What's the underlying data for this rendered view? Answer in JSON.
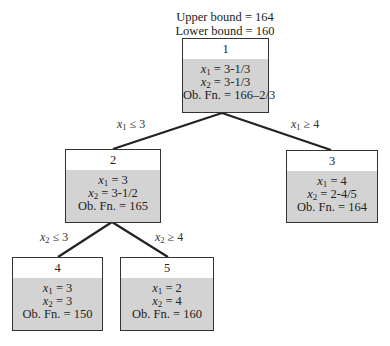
{
  "bounds": {
    "upper": "Upper bound = 164",
    "lower": "Lower bound = 160"
  },
  "nodes": [
    {
      "id": "1",
      "x1": "= 3-1/3",
      "x2": "= 3-1/3",
      "obfn": "Ob. Fn. = 166–2/3"
    },
    {
      "id": "2",
      "x1": "= 3",
      "x2": "= 3-1/2",
      "obfn": "Ob. Fn. = 165"
    },
    {
      "id": "3",
      "x1": "= 4",
      "x2": "= 2-4/5",
      "obfn": "Ob. Fn. = 164"
    },
    {
      "id": "4",
      "x1": "= 3",
      "x2": "= 3",
      "obfn": "Ob. Fn. = 150"
    },
    {
      "id": "5",
      "x1": "= 2",
      "x2": "= 4",
      "obfn": "Ob. Fn. = 160"
    }
  ],
  "edges": [
    {
      "from": "1",
      "to": "2",
      "var": "x",
      "sub": "1",
      "op": " ≤ 3"
    },
    {
      "from": "1",
      "to": "3",
      "var": "x",
      "sub": "1",
      "op": " ≥ 4"
    },
    {
      "from": "2",
      "to": "4",
      "var": "x",
      "sub": "2",
      "op": " ≤ 3"
    },
    {
      "from": "2",
      "to": "5",
      "var": "x",
      "sub": "2",
      "op": " ≥ 4"
    }
  ],
  "labels": {
    "var": "x",
    "sub1": "1",
    "sub2": "2"
  },
  "colors": {
    "box_fill": "#d3d3d3",
    "header_fill": "#ffffff",
    "line": "#222222"
  }
}
